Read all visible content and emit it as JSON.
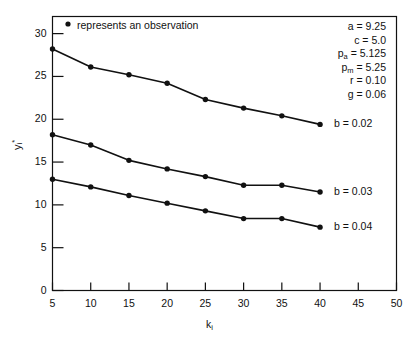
{
  "legend": {
    "marker": "filled-circle",
    "text": "represents an observation"
  },
  "parameters": [
    {
      "name": "a",
      "sub": "",
      "value": "9.25"
    },
    {
      "name": "c",
      "sub": "",
      "value": "5.0"
    },
    {
      "name": "p",
      "sub": "a",
      "value": "5.125"
    },
    {
      "name": "p",
      "sub": "m",
      "value": "5.25"
    },
    {
      "name": "r",
      "sub": "",
      "value": "0.10"
    },
    {
      "name": "g",
      "sub": "",
      "value": "0.06"
    }
  ],
  "axes": {
    "xlabel_base": "k",
    "xlabel_sub": "i",
    "ylabel_base": "y",
    "ylabel_sub": "i",
    "ylabel_sup": "*",
    "xticks": [
      "5",
      "10",
      "15",
      "20",
      "25",
      "30",
      "35",
      "40",
      "45",
      "50"
    ],
    "yticks": [
      "0",
      "5",
      "10",
      "15",
      "20",
      "25",
      "30"
    ]
  },
  "curve_labels": [
    {
      "text": "b = 0.02"
    },
    {
      "text": "b = 0.03"
    },
    {
      "text": "b = 0.04"
    }
  ],
  "chart_data": {
    "type": "line",
    "title": "",
    "xlabel": "k_i",
    "ylabel": "y_i*",
    "xlim": [
      5,
      50
    ],
    "ylim": [
      0,
      32
    ],
    "grid": false,
    "legend": "right-of-curve end labels",
    "x": [
      5,
      10,
      15,
      20,
      25,
      30,
      35,
      40
    ],
    "series": [
      {
        "name": "b = 0.02",
        "values": [
          28.2,
          26.1,
          25.2,
          24.2,
          22.3,
          21.3,
          20.4,
          19.4
        ]
      },
      {
        "name": "b = 0.03",
        "values": [
          18.2,
          17.0,
          15.2,
          14.2,
          13.3,
          12.3,
          12.3,
          11.5
        ]
      },
      {
        "name": "b = 0.04",
        "values": [
          13.0,
          12.1,
          11.1,
          10.2,
          9.3,
          8.4,
          8.4,
          7.4
        ]
      }
    ],
    "annotations": [
      {
        "text": "a = 9.25"
      },
      {
        "text": "c = 5.0"
      },
      {
        "text": "p_a = 5.125"
      },
      {
        "text": "p_m = 5.25"
      },
      {
        "text": "r = 0.10"
      },
      {
        "text": "g = 0.06"
      },
      {
        "text": "represents an observation"
      }
    ]
  }
}
